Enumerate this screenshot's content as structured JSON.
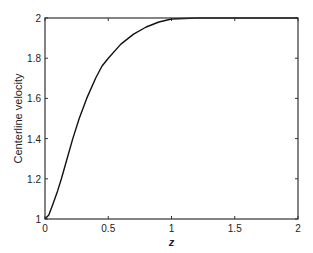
{
  "chart_data": {
    "type": "line",
    "title": "",
    "xlabel": "z",
    "ylabel": "Centerline velocity",
    "xlim": [
      0,
      2
    ],
    "ylim": [
      1,
      2
    ],
    "grid": false,
    "legend": null,
    "x_ticks": [
      0,
      0.5,
      1,
      1.5,
      2
    ],
    "x_tick_labels": [
      "0",
      "0.5",
      "1",
      "1.5",
      "2"
    ],
    "y_ticks": [
      1,
      1.2,
      1.4,
      1.6,
      1.8,
      2
    ],
    "y_tick_labels": [
      "1",
      "1.2",
      "1.4",
      "1.6",
      "1.8",
      "2"
    ],
    "series": [
      {
        "name": "centerline velocity",
        "color": "#111111",
        "x": [
          0,
          0.03,
          0.06,
          0.1,
          0.13,
          0.17,
          0.22,
          0.27,
          0.33,
          0.4,
          0.45,
          0.5,
          0.6,
          0.7,
          0.8,
          0.9,
          1.0,
          1.2,
          1.5,
          2.0
        ],
        "y": [
          1.0,
          1.02,
          1.07,
          1.14,
          1.2,
          1.29,
          1.4,
          1.5,
          1.6,
          1.7,
          1.76,
          1.8,
          1.87,
          1.92,
          1.955,
          1.98,
          1.995,
          2.0,
          2.0,
          2.0
        ]
      }
    ]
  }
}
